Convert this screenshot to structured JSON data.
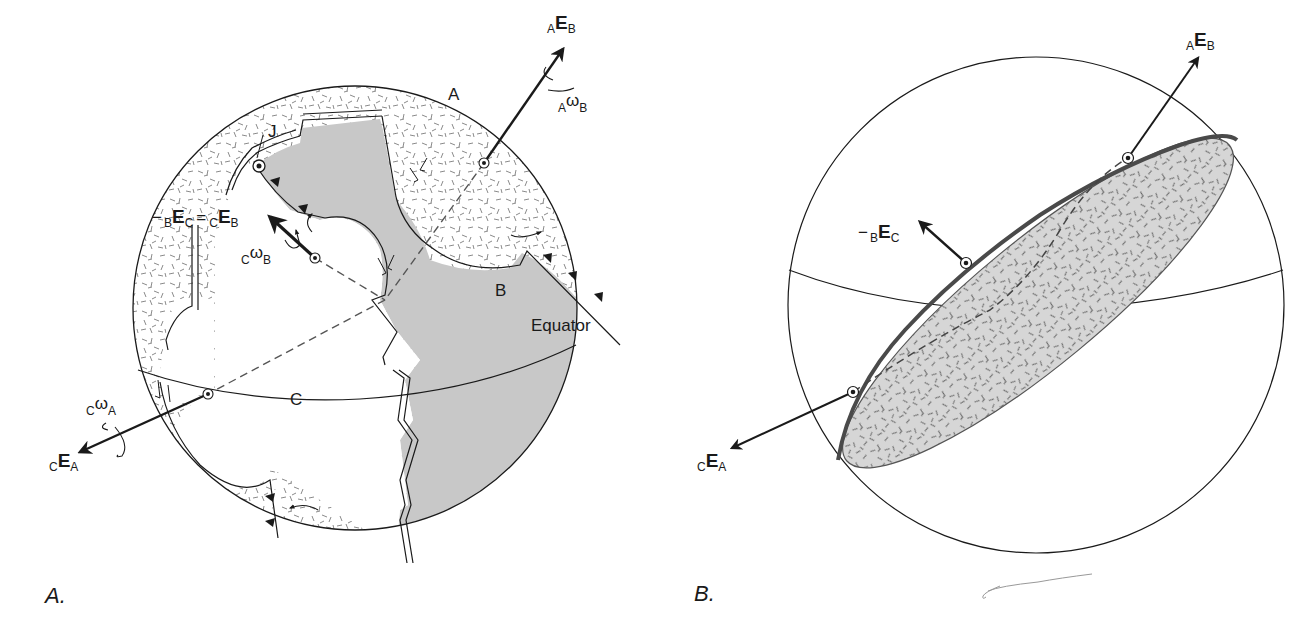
{
  "figure": {
    "panels": [
      {
        "id": "A",
        "panel_label": "A.",
        "plates": [
          {
            "name": "A",
            "label": "A",
            "fill": "stippled"
          },
          {
            "name": "B",
            "label": "B",
            "fill": "#c8c8c8"
          },
          {
            "name": "C",
            "label": "C",
            "fill": "#ffffff"
          }
        ],
        "point_label": "J",
        "equator_label": "Equator",
        "vectors": [
          {
            "id": "AEB",
            "pre": "A",
            "main": "E",
            "post": "B"
          },
          {
            "id": "AwB",
            "pre": "A",
            "main": "ω",
            "post": "B"
          },
          {
            "id": "CEB_eq",
            "minus": "−",
            "pre1": "B",
            "main1": "E",
            "post1": "C",
            "eq": "=",
            "pre2": "C",
            "main2": "E",
            "post2": "B"
          },
          {
            "id": "CwB",
            "pre": "C",
            "main": "ω",
            "post": "B"
          },
          {
            "id": "CwA",
            "pre": "C",
            "main": "ω",
            "post": "A"
          },
          {
            "id": "CEA",
            "pre": "C",
            "main": "E",
            "post": "A"
          }
        ]
      },
      {
        "id": "B",
        "panel_label": "B.",
        "vectors": [
          {
            "id": "AEB",
            "pre": "A",
            "main": "E",
            "post": "B"
          },
          {
            "id": "BEC",
            "minus": "−",
            "pre": "B",
            "main": "E",
            "post": "C"
          },
          {
            "id": "CEA",
            "pre": "C",
            "main": "E",
            "post": "A"
          }
        ]
      }
    ],
    "colors": {
      "line": "#1a1a1a",
      "plate_b_gray": "#c8c8c8",
      "stipple_plane": "#d4d4d4",
      "stipple_mark": "#7a7a7a"
    }
  }
}
